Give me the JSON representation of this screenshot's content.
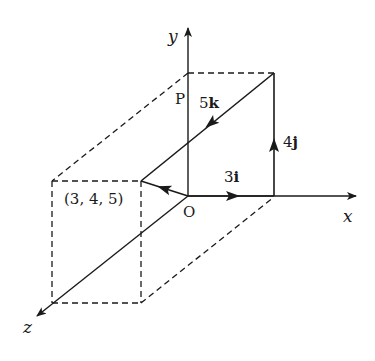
{
  "diagram": {
    "type": "3d-vector-decomposition",
    "axes": {
      "x": "x",
      "y": "y",
      "z": "z"
    },
    "origin_label": "O",
    "point_label": "P",
    "point_coords": "(3, 4, 5)",
    "components": [
      {
        "label_num": "3",
        "label_unit": "i",
        "direction": "x"
      },
      {
        "label_num": "4",
        "label_unit": "j",
        "direction": "y"
      },
      {
        "label_num": "5",
        "label_unit": "k",
        "direction": "z"
      }
    ],
    "colors": {
      "line": "#1a1a1a",
      "background": "#ffffff"
    }
  }
}
